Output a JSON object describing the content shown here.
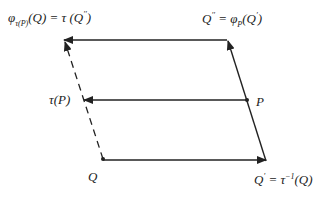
{
  "diagram": {
    "labels": {
      "top_left": {
        "base": "φ",
        "sub": "τ(P)",
        "rest": "(Q) = τ (Q",
        "sup": "′′",
        "close": ")"
      },
      "top_right": {
        "base": "Q",
        "sup": "′′",
        "mid": " = φ",
        "sub": "P",
        "rest": "(Q",
        "sup2": "′",
        "close": ")"
      },
      "mid_left": {
        "text": "τ(P)"
      },
      "mid_right": {
        "text": "P"
      },
      "bottom_left": {
        "text": "Q"
      },
      "bottom_right": {
        "base": "Q",
        "sup": "′",
        "mid": " = τ",
        "sup2": "−1",
        "rest": "(Q)"
      }
    },
    "points": {
      "Q": [
        103,
        159
      ],
      "Q_prime": [
        266,
        161
      ],
      "P": [
        247,
        100
      ],
      "tau_P": [
        84,
        100
      ],
      "Q_double_prime": [
        227,
        40
      ],
      "phi_tau_P_Q": [
        64,
        40
      ]
    },
    "colors": {
      "stroke": "#222222",
      "background": "#ffffff"
    }
  }
}
